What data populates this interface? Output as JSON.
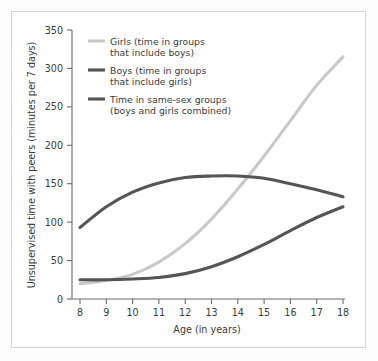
{
  "chart_data": {
    "type": "line",
    "title": "",
    "xlabel": "Age (in years)",
    "ylabel": "Unsupervised time with peers (minutes per 7 days)",
    "xlim": [
      8,
      18
    ],
    "ylim": [
      0,
      350
    ],
    "grid": false,
    "legend_position": "upper-left-inside",
    "x_ticks": [
      8,
      9,
      10,
      11,
      12,
      13,
      14,
      15,
      16,
      17,
      18
    ],
    "x_tick_labels": [
      "8",
      "9",
      "10",
      "11",
      "12",
      "13",
      "14",
      "15",
      "16",
      "17",
      "18"
    ],
    "y_ticks": [
      0,
      50,
      100,
      150,
      200,
      250,
      300,
      350
    ],
    "y_tick_labels": [
      "0",
      "50",
      "100",
      "150",
      "200",
      "250",
      "300",
      "350"
    ],
    "x": [
      8,
      9,
      10,
      11,
      12,
      13,
      14,
      15,
      16,
      17,
      18
    ],
    "series": [
      {
        "name": "Girls (time in groups that include boys)",
        "legend_label_line1": "Girls (time in groups",
        "legend_label_line2": "that include boys)",
        "color": "#c9c9c9",
        "width": 3.1,
        "values": [
          20,
          24,
          32,
          48,
          72,
          104,
          143,
          186,
          232,
          278,
          315
        ]
      },
      {
        "name": "Boys (time in groups that include girls)",
        "legend_label_line1": "Boys (time in groups",
        "legend_label_line2": "that include girls)",
        "color": "#555555",
        "width": 3.1,
        "values": [
          25,
          25,
          26,
          28,
          33,
          42,
          55,
          71,
          89,
          106,
          120
        ]
      },
      {
        "name": "Time in same-sex groups (boys and girls combined)",
        "legend_label_line1": "Time in same-sex groups",
        "legend_label_line2": "(boys and girls combined)",
        "color": "#555555",
        "width": 3.1,
        "values": [
          93,
          120,
          139,
          151,
          158,
          160,
          160,
          157,
          150,
          142,
          133
        ]
      }
    ],
    "annotations": [
      {
        "kind": "crossing",
        "label": "girls crosses same-sex",
        "x": 15.3,
        "y": 157
      },
      {
        "kind": "crossing",
        "label": "boys crosses same-sex",
        "x": 17.8,
        "y": 126
      }
    ]
  },
  "colors": {
    "frame_border": "#d6d6d6",
    "axis": "#6b6b6b",
    "text": "#3a3a3a",
    "page_background": "#fdfdfd",
    "plot_background": "#ffffff",
    "light_series": "#c9c9c9",
    "dark_series": "#555555"
  }
}
